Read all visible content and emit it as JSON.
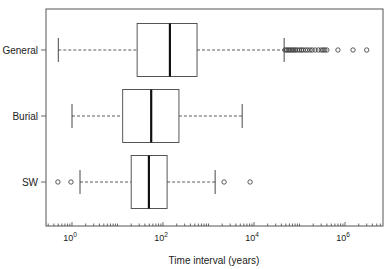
{
  "chart_data": {
    "type": "boxplot",
    "orientation": "horizontal",
    "title": "",
    "xlabel": "Time interval (years)",
    "ylabel": "",
    "xscale": "log10",
    "xlim": [
      0.3,
      100000000
    ],
    "xticks": [
      {
        "value": 1,
        "label_base": "10",
        "label_exp": "0"
      },
      {
        "value": 100,
        "label_base": "10",
        "label_exp": "2"
      },
      {
        "value": 10000,
        "label_base": "10",
        "label_exp": "4"
      },
      {
        "value": 1000000,
        "label_base": "10",
        "label_exp": "6"
      }
    ],
    "categories": [
      "General",
      "Burial",
      "SW"
    ],
    "series": [
      {
        "name": "General",
        "whisker_low": 0.5,
        "q1": 27,
        "median": 142,
        "q3": 560,
        "whisker_high": 46000,
        "outliers": [
          48000,
          52000,
          56000,
          60000,
          65000,
          70000,
          76000,
          82000,
          90000,
          100000,
          110000,
          120000,
          135000,
          150000,
          170000,
          190000,
          220000,
          260000,
          300000,
          330000,
          360000,
          400000,
          700000,
          1500000,
          3000000
        ]
      },
      {
        "name": "Burial",
        "whisker_low": 1.0,
        "q1": 13,
        "median": 55,
        "q3": 224,
        "whisker_high": 5500,
        "outliers": []
      },
      {
        "name": "SW",
        "whisker_low": 1.5,
        "q1": 20,
        "median": 49,
        "q3": 123,
        "whisker_high": 1400,
        "outliers": [
          0.49,
          0.95,
          2200,
          8200
        ]
      }
    ],
    "grid": false,
    "legend": "none"
  }
}
